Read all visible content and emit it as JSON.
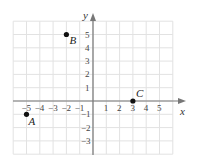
{
  "chart_data": {
    "type": "scatter",
    "title": "",
    "xlabel": "x",
    "ylabel": "y",
    "xlim": [
      -6,
      6
    ],
    "ylim": [
      -4,
      6
    ],
    "grid": true,
    "x_ticks": [
      "-5",
      "-4",
      "-3",
      "-2",
      "-1",
      "1",
      "2",
      "3",
      "4",
      "5"
    ],
    "y_ticks": [
      "5",
      "4",
      "3",
      "2",
      "1",
      "-1",
      "-2",
      "-3"
    ],
    "points": [
      {
        "label": "A",
        "x": -5,
        "y": -1
      },
      {
        "label": "B",
        "x": -2,
        "y": 5
      },
      {
        "label": "C",
        "x": 3,
        "y": 0
      }
    ]
  },
  "axes": {
    "x_label": "x",
    "y_label": "y"
  },
  "colors": {
    "grid": "#e2e2e2",
    "axis": "#777777",
    "point": "#111111"
  }
}
